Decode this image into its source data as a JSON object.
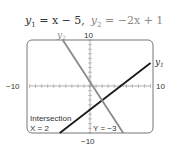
{
  "chart_data": {
    "type": "line",
    "title_parts": {
      "eq1": "= x − 5,",
      "eq2": "= −2x + 1"
    },
    "xlim": [
      -10,
      10
    ],
    "ylim": [
      -10,
      10
    ],
    "xtick_step": 1,
    "ytick_step": 1,
    "tick_labels": {
      "xmin": "−10",
      "xmax": "10",
      "ymax": "10",
      "ymin": "−10"
    },
    "series": [
      {
        "name": "y1",
        "label": "y",
        "sub": "1",
        "slope": 1,
        "intercept": -5,
        "color": "#1a1a1a",
        "x_range": [
          -5,
          10
        ]
      },
      {
        "name": "y2",
        "label": "y",
        "sub": "2",
        "slope": -2,
        "intercept": 1,
        "color": "#8a8a8a",
        "x_range": [
          -4.5,
          5.5
        ]
      }
    ],
    "annotations": {
      "intersection_label": "Intersection",
      "x_readout": "X = 2",
      "y_readout": "Y = −3"
    },
    "intersection": {
      "x": 2,
      "y": -3
    }
  }
}
